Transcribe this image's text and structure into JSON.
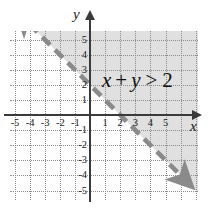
{
  "chart_data": {
    "type": "line",
    "title": "",
    "xlabel": "x",
    "ylabel": "y",
    "xlim": [
      -6.2,
      6.3
    ],
    "ylim": [
      -5.8,
      5.4
    ],
    "grid": true,
    "legend": "none",
    "annotations": [
      {
        "text": "x + y > 2",
        "x": 3.2,
        "y": 2.1
      }
    ],
    "x_ticks": [
      "-5",
      "-4",
      "-3",
      "-2",
      "-1",
      "1",
      "2",
      "3",
      "4",
      "5"
    ],
    "x_tick_values": [
      -5,
      -4,
      -3,
      -2,
      -1,
      1,
      2,
      3,
      4,
      5
    ],
    "y_ticks": [
      "5",
      "4",
      "3",
      "2",
      "1",
      "-1",
      "-2",
      "-3",
      "-4",
      "-5"
    ],
    "y_tick_values": [
      5,
      4,
      3,
      2,
      1,
      -1,
      -2,
      -3,
      -4,
      -5
    ],
    "series": [
      {
        "name": "x + y = 2",
        "style": "dashed",
        "arrows": "both",
        "equation": "x + y = 2",
        "slope": -1,
        "intercept": 2,
        "x": [
          -4.0,
          5.9
        ],
        "y": [
          6.0,
          -3.9
        ]
      }
    ],
    "shaded_region": {
      "inequality": "x + y > 2",
      "relation": ">",
      "boundary_included": false,
      "side": "above-right",
      "color": "#d9d9d9"
    },
    "colors": {
      "axis": "#3a3a3a",
      "grid": "#8d8d8d",
      "line": "#7a7a7a",
      "shade": "#d9d9d9",
      "text": "#1a1a1a",
      "background": "#ffffff"
    }
  },
  "labels": {
    "inequality_lhs_x": "x",
    "inequality_plus": "+",
    "inequality_lhs_y": "y",
    "inequality_relation": ">",
    "inequality_rhs": "2",
    "axis_x_name": "x",
    "axis_y_name": "y"
  }
}
